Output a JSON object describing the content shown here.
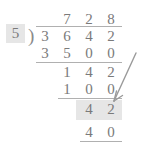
{
  "figure": {
    "operation": "long-division",
    "divisor": "5",
    "dividend": "3642",
    "quotient": "728",
    "colors": {
      "digit": "#7a7a7a",
      "rule": "#b0b0b0",
      "highlight": "#e6e6e6",
      "background": "#ffffff",
      "arrow": "#9a9a9a"
    }
  },
  "divisor": {
    "digit": "5",
    "highlighted": true
  },
  "bracket": {
    "glyph": ")"
  },
  "quotient": {
    "digits": [
      "7",
      "2",
      "8"
    ]
  },
  "rows": [
    {
      "name": "dividend",
      "digits": [
        "3",
        "6",
        "4",
        "2"
      ],
      "underlined": false,
      "highlighted": false
    },
    {
      "name": "first-subtrahend",
      "digits": [
        "3",
        "5",
        "0",
        "0"
      ],
      "underlined": true,
      "highlighted": false
    },
    {
      "name": "first-remainder",
      "digits": [
        "1",
        "4",
        "2"
      ],
      "underlined": false,
      "highlighted": false
    },
    {
      "name": "second-subtrahend",
      "digits": [
        "1",
        "0",
        "0"
      ],
      "underlined": true,
      "highlighted": false
    },
    {
      "name": "second-remainder",
      "digits": [
        "4",
        "2"
      ],
      "underlined": false,
      "highlighted": true
    },
    {
      "name": "third-subtrahend",
      "digits": [
        "4",
        "0"
      ],
      "underlined": true,
      "highlighted": false
    }
  ],
  "annotation": {
    "arrow": {
      "name": "pointer-arrow",
      "points_to": "second-remainder",
      "direction": "down-left"
    }
  }
}
